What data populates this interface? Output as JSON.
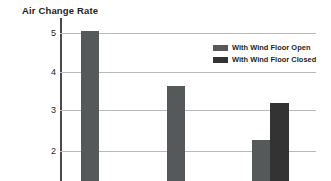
{
  "chart_data": {
    "type": "bar",
    "title": "Air Change Rate",
    "xlabel": "",
    "ylabel": "",
    "categories": [
      "Group 1",
      "Group 2",
      "Group 3"
    ],
    "ylim": [
      1.55,
      5.35
    ],
    "yticks": [
      2,
      3,
      4,
      5
    ],
    "ytick_labels": [
      "2",
      "3",
      "4",
      "5"
    ],
    "grid": true,
    "legend_position": "upper right",
    "series": [
      {
        "name": "With Wind Floor Open",
        "color": "#55595a",
        "values": [
          5.05,
          3.64,
          2.28
        ]
      },
      {
        "name": "With Wind Floor Closed",
        "color": "#333333",
        "values": [
          null,
          null,
          3.22
        ]
      }
    ],
    "bars": [
      {
        "label": "With Wind Floor Open",
        "value": 5.05,
        "color": "#55595a",
        "x": 81,
        "width": 18
      },
      {
        "label": "With Wind Floor Open",
        "value": 3.64,
        "color": "#55595a",
        "x": 167,
        "width": 18
      },
      {
        "label": "With Wind Floor Open",
        "value": 2.28,
        "color": "#55595a",
        "x": 252,
        "width": 18
      },
      {
        "label": "With Wind Floor Closed",
        "value": 3.22,
        "color": "#333333",
        "x": 270,
        "width": 19
      }
    ]
  },
  "chart": {
    "title": "Air Change Rate",
    "axis": {
      "tick_5": "5",
      "tick_4": "4",
      "tick_3": "3",
      "tick_2": "2"
    },
    "legend": {
      "items": [
        {
          "label": "With Wind Floor Open",
          "color": "#55595a"
        },
        {
          "label": "With Wind Floor Closed",
          "color": "#333333"
        }
      ]
    },
    "colors": {
      "open": "#55595a",
      "closed": "#333333",
      "gridline": "#b9b9b9",
      "axis": "#4a4a4a",
      "text": "#231f20",
      "background": "#ffffff"
    }
  }
}
